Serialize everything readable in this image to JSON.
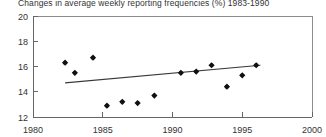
{
  "chart_data": {
    "type": "scatter",
    "title": "Changes in average weekly reporting frequencies (%) 1983-1990",
    "xlabel": "",
    "ylabel": "",
    "xlim": [
      1980,
      2000
    ],
    "ylim": [
      12,
      20
    ],
    "grid": false,
    "legend": null,
    "xticks": [
      1980,
      1985,
      1990,
      1995,
      2000
    ],
    "yticks": [
      12,
      14,
      16,
      18,
      20
    ],
    "series": [
      {
        "name": "Average weekly reporting frequency",
        "marker": "diamond",
        "x": [
          1982.3,
          1983.0,
          1984.3,
          1985.3,
          1986.4,
          1987.5,
          1988.7,
          1990.6,
          1991.7,
          1992.8,
          1993.9,
          1995.0,
          1996.0
        ],
        "values": [
          16.3,
          15.5,
          16.7,
          12.9,
          13.2,
          13.1,
          13.7,
          15.5,
          15.6,
          16.1,
          14.4,
          15.3,
          16.1
        ]
      },
      {
        "name": "Linear trend",
        "type": "line",
        "x": [
          1982.3,
          1996.3
        ],
        "values": [
          14.7,
          16.1
        ]
      }
    ]
  },
  "axis": {
    "x_tick_labels": [
      "1980",
      "1985",
      "1990",
      "1995",
      "2000"
    ],
    "y_tick_labels": [
      "12",
      "14",
      "16",
      "18",
      "20"
    ]
  }
}
